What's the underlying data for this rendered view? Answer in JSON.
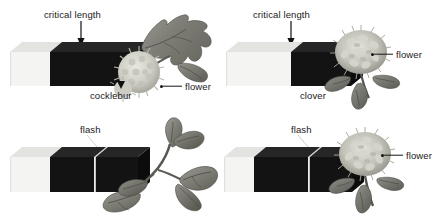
{
  "figure": {
    "background_color": "#ffffff",
    "text_color": "#1a1a1a",
    "light_bar_color": "#f2f2f0",
    "dark_bar_color": "#131313",
    "flash_line_color": "#efefed"
  },
  "panels": [
    {
      "id": "top-left",
      "plant": "cocklebur",
      "plant_label": "cocklebur",
      "critical_label": "critical length",
      "flower_label": "flower",
      "flowering": "yes",
      "bar": {
        "light_segment": "short",
        "dark_segment": "long",
        "flash": "none"
      }
    },
    {
      "id": "top-right",
      "plant": "clover",
      "plant_label": "clover",
      "critical_label": "critical length",
      "flower_label": "flower",
      "flowering": "yes",
      "bar": {
        "light_segment": "long",
        "dark_segment": "short",
        "flash": "none"
      }
    },
    {
      "id": "bottom-left",
      "plant": "cocklebur",
      "plant_label": "",
      "flash_label": "flash",
      "flower_label": "",
      "flowering": "no",
      "bar": {
        "light_segment": "short",
        "dark_segment": "long",
        "flash": "present"
      }
    },
    {
      "id": "bottom-right",
      "plant": "clover",
      "plant_label": "",
      "flash_label": "flash",
      "flower_label": "flower",
      "flowering": "yes",
      "bar": {
        "light_segment": "short",
        "dark_segment": "long",
        "flash": "present"
      }
    }
  ],
  "labels": {
    "tl_critical": "critical length",
    "tl_plant": "cocklebur",
    "tl_flower": "flower",
    "tr_critical": "critical length",
    "tr_plant": "clover",
    "tr_flower": "flower",
    "bl_flash": "flash",
    "br_flash": "flash",
    "br_flower": "flower"
  }
}
